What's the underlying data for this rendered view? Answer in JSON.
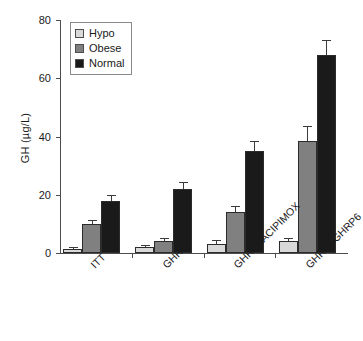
{
  "chart_data": {
    "type": "bar",
    "title": "",
    "subtitle": "",
    "xlabel": "",
    "ylabel": "GH (µg/L)",
    "ylim": [
      0,
      80
    ],
    "yticks": [
      0,
      20,
      40,
      60,
      80
    ],
    "ytick_labels": [
      "0",
      "20",
      "40",
      "60",
      "80"
    ],
    "grid": false,
    "legend_position": "top-left inside axes",
    "orientation": "vertical grouped",
    "error_bars": "upper-only whisker with cap (SEM)",
    "categories": [
      "ITT",
      "GHRH",
      "GHRH+ACIPIMOX",
      "GHRH+GHRP6"
    ],
    "series": [
      {
        "name": "Hypo",
        "color": "#d9d9d9",
        "values": [
          1.5,
          2.0,
          3.0,
          4.0
        ],
        "errors": [
          0.5,
          0.7,
          1.5,
          1.2
        ]
      },
      {
        "name": "Obese",
        "color": "#808080",
        "values": [
          10.0,
          4.0,
          14.0,
          38.5
        ],
        "errors": [
          1.3,
          1.2,
          2.2,
          5.0
        ]
      },
      {
        "name": "Normal",
        "color": "#1a1a1a",
        "values": [
          18.0,
          22.0,
          35.0,
          68.0
        ],
        "errors": [
          1.8,
          2.5,
          3.5,
          5.0
        ]
      }
    ]
  },
  "axes": {
    "y_axis_title": "GH (µg/L)"
  },
  "legend": {
    "entries": [
      {
        "label": "Hypo",
        "color": "#d9d9d9"
      },
      {
        "label": "Obese",
        "color": "#808080"
      },
      {
        "label": "Normal",
        "color": "#1a1a1a"
      }
    ]
  }
}
